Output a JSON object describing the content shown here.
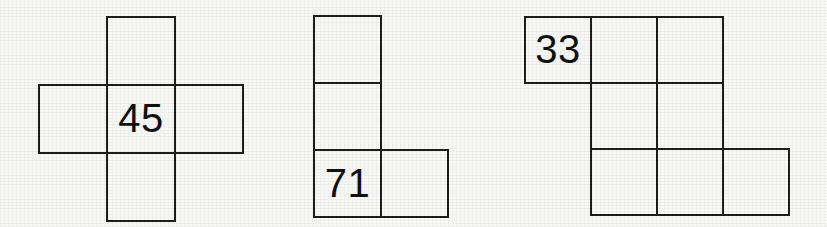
{
  "page": {
    "background_color": "#f8f8f7",
    "line_color": "#1d1d1d",
    "text_color": "#111111",
    "width": 827,
    "height": 227
  },
  "figures": [
    {
      "name": "plus-pentomino",
      "label": "45",
      "cell_size": 68,
      "origin_x": 38,
      "origin_y": 16,
      "cells": [
        {
          "col": 1,
          "row": 0,
          "label": ""
        },
        {
          "col": 0,
          "row": 1,
          "label": ""
        },
        {
          "col": 1,
          "row": 1,
          "label": "45"
        },
        {
          "col": 2,
          "row": 1,
          "label": ""
        },
        {
          "col": 1,
          "row": 2,
          "label": ""
        }
      ]
    },
    {
      "name": "l-tetromino",
      "label": "71",
      "cell_size": 67,
      "origin_x": 313,
      "origin_y": 15,
      "cells": [
        {
          "col": 0,
          "row": 0,
          "label": ""
        },
        {
          "col": 0,
          "row": 1,
          "label": ""
        },
        {
          "col": 0,
          "row": 2,
          "label": "71"
        },
        {
          "col": 1,
          "row": 2,
          "label": ""
        }
      ]
    },
    {
      "name": "s-octomino",
      "label": "33",
      "cell_size": 66,
      "origin_x": 524,
      "origin_y": 16,
      "cells": [
        {
          "col": 0,
          "row": 0,
          "label": "33"
        },
        {
          "col": 1,
          "row": 0,
          "label": ""
        },
        {
          "col": 2,
          "row": 0,
          "label": ""
        },
        {
          "col": 1,
          "row": 1,
          "label": ""
        },
        {
          "col": 2,
          "row": 1,
          "label": ""
        },
        {
          "col": 1,
          "row": 2,
          "label": ""
        },
        {
          "col": 2,
          "row": 2,
          "label": ""
        },
        {
          "col": 3,
          "row": 2,
          "label": ""
        }
      ]
    }
  ]
}
